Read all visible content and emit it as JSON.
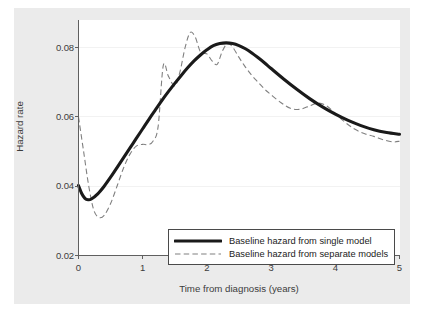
{
  "chart_data": {
    "type": "line",
    "title": "",
    "xlabel": "Time from diagnosis (years)",
    "ylabel": "Hazard rate",
    "xlim": [
      0,
      5
    ],
    "ylim": [
      0.02,
      0.088
    ],
    "xticks": [
      "0",
      "1",
      "2",
      "3",
      "4",
      "5"
    ],
    "xtick_values": [
      0,
      1,
      2,
      3,
      4,
      5
    ],
    "yticks": [
      "0.02",
      "0.04",
      "0.06",
      "0.08"
    ],
    "ytick_values": [
      0.02,
      0.04,
      0.06,
      0.08
    ],
    "grid": "horizontal",
    "legend_position": "lower right",
    "series": [
      {
        "name": "Baseline hazard from single model",
        "style": "solid",
        "color": "#1a1a1a",
        "x": [
          0.0,
          0.05,
          0.1,
          0.15,
          0.2,
          0.3,
          0.4,
          0.5,
          0.6,
          0.7,
          0.8,
          0.9,
          1.0,
          1.1,
          1.2,
          1.3,
          1.4,
          1.5,
          1.6,
          1.7,
          1.8,
          1.9,
          2.0,
          2.1,
          2.2,
          2.3,
          2.4,
          2.5,
          2.6,
          2.7,
          2.8,
          2.9,
          3.0,
          3.2,
          3.4,
          3.6,
          3.8,
          4.0,
          4.2,
          4.4,
          4.6,
          4.8,
          5.0
        ],
        "y": [
          0.0402,
          0.0379,
          0.0365,
          0.0361,
          0.0363,
          0.0378,
          0.04,
          0.0426,
          0.0454,
          0.0482,
          0.051,
          0.0538,
          0.0566,
          0.0594,
          0.0621,
          0.0648,
          0.0673,
          0.0697,
          0.072,
          0.0742,
          0.0762,
          0.0779,
          0.0794,
          0.0806,
          0.0812,
          0.0814,
          0.0812,
          0.0806,
          0.0797,
          0.0785,
          0.0771,
          0.0756,
          0.074,
          0.0709,
          0.068,
          0.0653,
          0.0629,
          0.0608,
          0.059,
          0.0575,
          0.0563,
          0.0555,
          0.055
        ]
      },
      {
        "name": "Baseline hazard from separate models",
        "style": "dashed",
        "color": "#808080",
        "x": [
          0.0,
          0.08,
          0.16,
          0.24,
          0.32,
          0.4,
          0.5,
          0.6,
          0.7,
          0.8,
          0.9,
          1.0,
          1.08,
          1.16,
          1.24,
          1.32,
          1.4,
          1.5,
          1.58,
          1.66,
          1.74,
          1.82,
          1.9,
          2.0,
          2.08,
          2.16,
          2.24,
          2.32,
          2.4,
          2.5,
          2.6,
          2.7,
          2.8,
          2.9,
          3.0,
          3.15,
          3.3,
          3.45,
          3.6,
          3.72,
          3.85,
          4.0,
          4.15,
          4.3,
          4.45,
          4.6,
          4.75,
          4.9,
          5.0
        ],
        "y": [
          0.06,
          0.05,
          0.04,
          0.033,
          0.031,
          0.0316,
          0.035,
          0.04,
          0.0452,
          0.0492,
          0.0516,
          0.0521,
          0.052,
          0.053,
          0.0572,
          0.0748,
          0.0718,
          0.069,
          0.073,
          0.08,
          0.0844,
          0.083,
          0.0788,
          0.0782,
          0.0762,
          0.0752,
          0.079,
          0.0812,
          0.0802,
          0.0772,
          0.0744,
          0.072,
          0.07,
          0.068,
          0.0664,
          0.0642,
          0.0625,
          0.0622,
          0.0632,
          0.064,
          0.0634,
          0.061,
          0.0585,
          0.0565,
          0.0552,
          0.0544,
          0.0534,
          0.0528,
          0.053
        ]
      }
    ]
  },
  "legend": {
    "items": [
      {
        "label": "Baseline hazard from single model",
        "style": "solid"
      },
      {
        "label": "Baseline hazard from separate models",
        "style": "dashed"
      }
    ]
  },
  "colors": {
    "solid_series": "#1a1a1a",
    "dashed_series": "#808080",
    "panel_background": "#ffffff",
    "outer_background": "#ebebeb",
    "axis": "#5f5f5f",
    "gridline": "#f2f2f2"
  }
}
